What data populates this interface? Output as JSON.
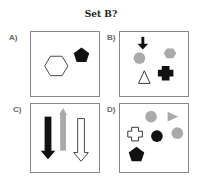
{
  "title": "Set B?",
  "panels": [
    {
      "label": "A)",
      "shapes": [
        "hexagon-outline",
        "pentagon-black"
      ]
    },
    {
      "label": "B)",
      "shapes": [
        "arrow-down-black",
        "circle-gray",
        "hexagon-gray",
        "triangle-outline",
        "cross-black"
      ]
    },
    {
      "label": "C)",
      "shapes": [
        "arrow-down-black",
        "arrow-up-gray",
        "arrow-down-outline"
      ]
    },
    {
      "label": "D)",
      "shapes": [
        "circle-gray",
        "triangle-right-gray",
        "cross-outline",
        "circle-black",
        "circle-gray",
        "pentagon-black"
      ]
    }
  ],
  "colors": {
    "black": "#111111",
    "gray": "#aaaaaa",
    "border": "#888888"
  }
}
